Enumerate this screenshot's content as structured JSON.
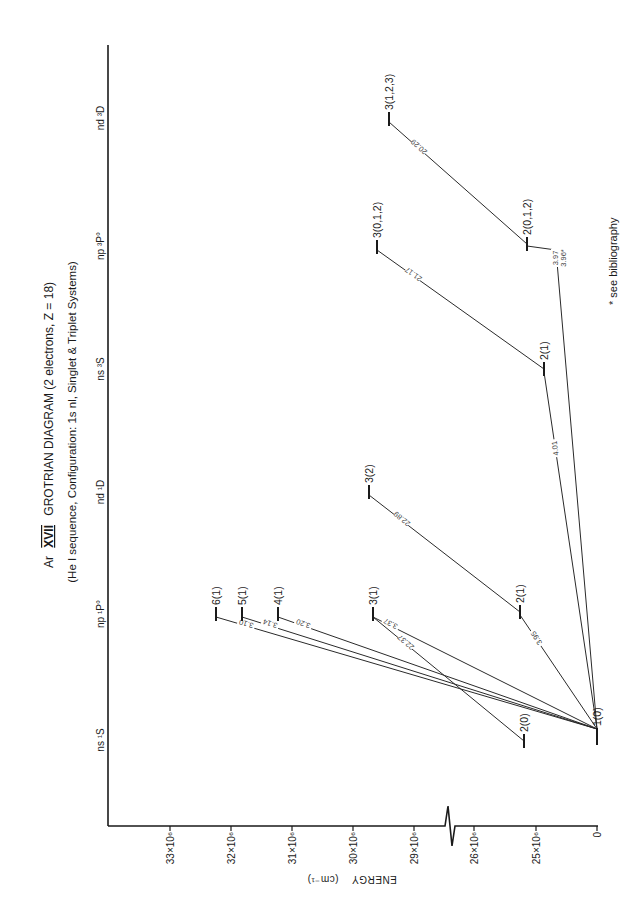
{
  "title": {
    "element": "Ar",
    "ion": "XVII",
    "main": "GROTRIAN DIAGRAM  (2 electrons, Z = 18)",
    "subtitle": "(He I sequence, Configuration: 1s nl, Singlet & Triplet Systems)"
  },
  "footnote": "* see  bibliography",
  "chart_data": {
    "type": "grotrian",
    "title": "Ar XVII GROTRIAN DIAGRAM (2 electrons, Z = 18)",
    "subtitle": "(He I sequence, Configuration: 1s nl, Singlet & Triplet Systems)",
    "energy_axis": {
      "label": "ENERGY",
      "unit": "(cm⁻¹)",
      "ticks": [
        {
          "value": 0,
          "label": "0"
        },
        {
          "value": 25000000,
          "label": "25×10⁶"
        },
        {
          "value": 26000000,
          "label": "26×10⁶"
        },
        {
          "value": 29000000,
          "label": "29×10⁶"
        },
        {
          "value": 30000000,
          "label": "30×10⁶"
        },
        {
          "value": 31000000,
          "label": "31×10⁶"
        },
        {
          "value": 32000000,
          "label": "32×10⁶"
        },
        {
          "value": 33000000,
          "label": "33×10⁶"
        }
      ],
      "axis_break_between": [
        26000000,
        29000000
      ]
    },
    "columns": [
      {
        "id": "ns1S",
        "label": "ns ¹S"
      },
      {
        "id": "np1P",
        "label": "np ¹P°"
      },
      {
        "id": "nd1D",
        "label": "nd ¹D"
      },
      {
        "id": "ns3S",
        "label": "ns ³S"
      },
      {
        "id": "np3P",
        "label": "np ³P°"
      },
      {
        "id": "nd3D",
        "label": "nd ³D"
      }
    ],
    "levels": [
      {
        "id": "g",
        "column": "ns1S",
        "label": "1(0)",
        "energy": 0
      },
      {
        "id": "s2",
        "column": "ns1S",
        "label": "2(0)",
        "energy": 24950000
      },
      {
        "id": "p2",
        "column": "np1P",
        "label": "2(1)",
        "energy": 25250000
      },
      {
        "id": "p3",
        "column": "np1P",
        "label": "3(1)",
        "energy": 29650000
      },
      {
        "id": "p4",
        "column": "np1P",
        "label": "4(1)",
        "energy": 31200000
      },
      {
        "id": "p5",
        "column": "np1P",
        "label": "5(1)",
        "energy": 31800000
      },
      {
        "id": "p6",
        "column": "np1P",
        "label": "6(1)",
        "energy": 32200000
      },
      {
        "id": "d3",
        "column": "nd1D",
        "label": "3(2)",
        "energy": 29650000
      },
      {
        "id": "t2s",
        "column": "ns3S",
        "label": "2(1)",
        "energy": 24850000
      },
      {
        "id": "t2p",
        "column": "np3P",
        "label": "2(0,1,2)",
        "energy": 25150000
      },
      {
        "id": "t3p",
        "column": "np3P",
        "label": "3(0,1,2)",
        "energy": 29600000
      },
      {
        "id": "t3d",
        "column": "nd3D",
        "label": "3(1,2,3)",
        "energy": 29400000
      }
    ],
    "transitions": [
      {
        "from": "p6",
        "to": "g",
        "wavelength": "3.10"
      },
      {
        "from": "p5",
        "to": "g",
        "wavelength": "3.14"
      },
      {
        "from": "p4",
        "to": "g",
        "wavelength": "3.20"
      },
      {
        "from": "p3",
        "to": "g",
        "wavelength": "3.37"
      },
      {
        "from": "p3",
        "to": "s2",
        "wavelength": "22.37"
      },
      {
        "from": "p2",
        "to": "g",
        "wavelength": "3.95"
      },
      {
        "from": "d3",
        "to": "p2",
        "wavelength": "22.89"
      },
      {
        "from": "t3p",
        "to": "t2s",
        "wavelength": "21.17"
      },
      {
        "from": "t2s",
        "to": "g",
        "wavelength": "4.01"
      },
      {
        "from": "t2p",
        "to": "g",
        "wavelength": "3.97",
        "alt_wavelength": "3.96*"
      },
      {
        "from": "t3d",
        "to": "t2p",
        "wavelength": "20.29"
      }
    ],
    "wavelength_unit": "Å",
    "orientation": "rotated-90-ccw"
  }
}
